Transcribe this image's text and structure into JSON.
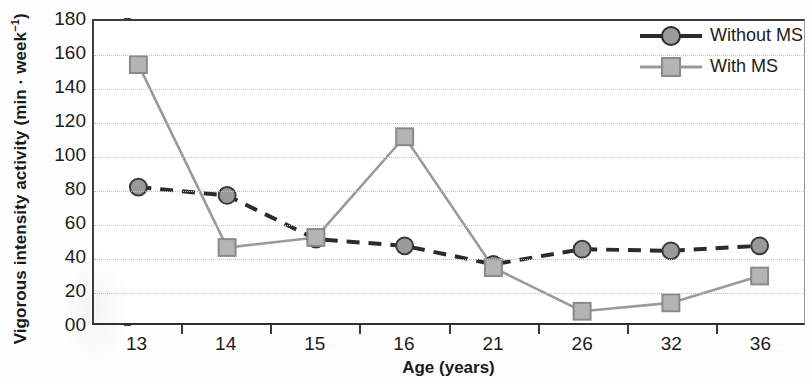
{
  "chart_data": {
    "type": "line",
    "title": "",
    "xlabel": "Age (years)",
    "ylabel": "Vigorous intensity activity (min · week⁻¹)",
    "ylabel_main": "Vigorous intensity activity (min · week",
    "ylabel_sup": "−1",
    "ylabel_tail": ")",
    "categories": [
      "13",
      "14",
      "15",
      "16",
      "21",
      "26",
      "32",
      "36"
    ],
    "x": [
      13,
      14,
      15,
      16,
      21,
      26,
      32,
      36
    ],
    "ylim": [
      0,
      180
    ],
    "ytick_labels": [
      "00",
      "20",
      "40",
      "60",
      "80",
      "100",
      "120",
      "140",
      "160",
      "180"
    ],
    "ytick_values": [
      0,
      20,
      40,
      60,
      80,
      100,
      120,
      140,
      160,
      180
    ],
    "grid": "horizontal-dotted",
    "legend_position": "top-right",
    "series": [
      {
        "name": "Without MS",
        "values": [
          81,
          76,
          50,
          46,
          35,
          44,
          43,
          46
        ],
        "color": "#2b2b2b",
        "marker": "circle",
        "marker_fill": "#9a9a9a",
        "line_style": "dashed"
      },
      {
        "name": "With MS",
        "values": [
          154,
          45,
          51,
          111,
          33,
          7,
          12,
          28
        ],
        "color": "#9a9a9a",
        "marker": "square",
        "marker_fill": "#b4b4b4",
        "line_style": "solid"
      }
    ]
  },
  "legend": {
    "items": [
      {
        "label": "Without MS"
      },
      {
        "label": "With MS"
      }
    ]
  },
  "colors": {
    "axis": "#3d3d3d",
    "grid": "#c2c2c2",
    "without_ms": "#2b2b2b",
    "with_ms": "#9a9a9a",
    "marker_fill": "#a8a8a8",
    "text": "#1c1c1c"
  }
}
